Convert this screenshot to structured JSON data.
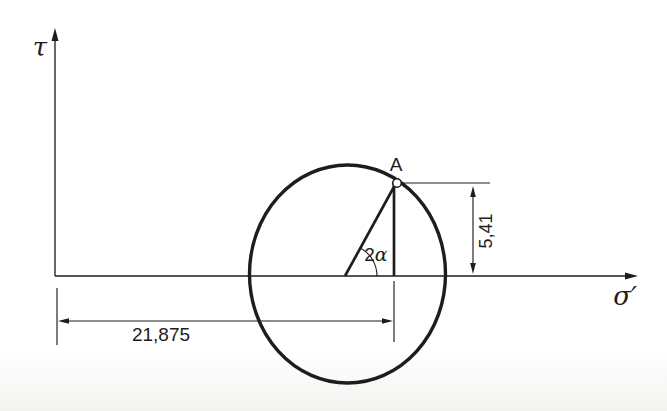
{
  "figure": {
    "axes": {
      "vertical_label": "τ",
      "horizontal_label": "σ′"
    },
    "point": {
      "label": "A"
    },
    "angle": {
      "prefix": "2",
      "symbol": "α",
      "full_label": "2α"
    },
    "dimensions": {
      "horizontal": {
        "label": "21,875",
        "value": 21.875
      },
      "vertical": {
        "label": "5,41",
        "value": 5.41
      }
    },
    "colors": {
      "ink": "#1d1d1d",
      "background": "#ffffff"
    }
  }
}
